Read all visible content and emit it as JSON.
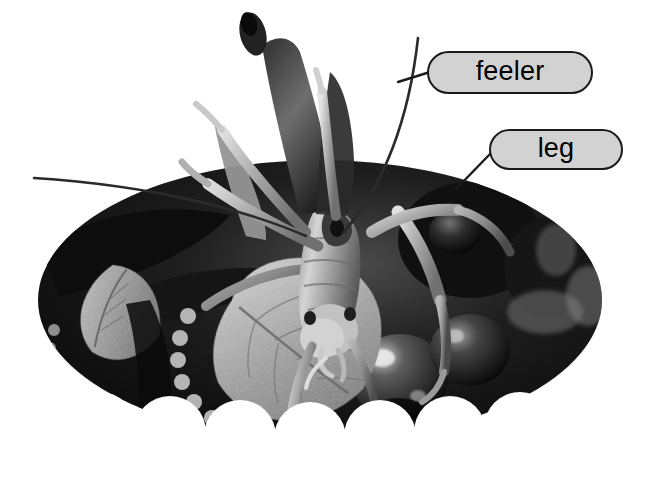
{
  "figure": {
    "type": "labeled-photograph",
    "palette": "grayscale",
    "background_color": "#ffffff",
    "photo_mask": "ellipse with scalloped bottom edge",
    "callout_fill": "#d2d2d2",
    "callout_border": "#1a1a1a",
    "leader_line_color": "#1a1a1a"
  },
  "callouts": [
    {
      "id": "feeler",
      "label": "feeler",
      "box": {
        "x": 427,
        "y": 51,
        "w": 166,
        "h": 43
      },
      "leader": {
        "x1": 398,
        "y1": 82,
        "x2": 427,
        "y2": 72
      },
      "points_to": "antenna"
    },
    {
      "id": "leg",
      "label": "leg",
      "box": {
        "x": 489,
        "y": 129,
        "w": 134,
        "h": 41
      },
      "leader": {
        "x1": 456,
        "y1": 189,
        "x2": 489,
        "y2": 152
      },
      "points_to": "hind leg"
    }
  ],
  "photo": {
    "ellipse": {
      "cx": 320,
      "cy": 300,
      "rx": 282,
      "ry": 140
    },
    "scallops": {
      "count": 8,
      "pitch": 70,
      "radius": 35,
      "baseline_y": 428
    }
  }
}
